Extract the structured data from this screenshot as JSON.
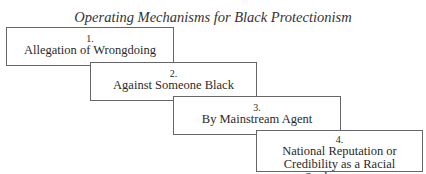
{
  "title": "Operating Mechanisms for Black Protectionism",
  "steps": [
    {
      "number": "1.",
      "label": "Allegation of Wrongdoing"
    },
    {
      "number": "2.",
      "label": "Against Someone Black"
    },
    {
      "number": "3.",
      "label": "By Mainstream Agent"
    },
    {
      "number": "4.",
      "label_line1": "National Reputation or",
      "label_line2": "Credibility as a Racial Spokesperson"
    }
  ]
}
